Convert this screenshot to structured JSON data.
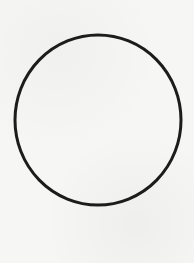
{
  "figure": {
    "shape": "circle-outline",
    "background_color": "#f6f6f4",
    "stroke_color": "#1c1c1c",
    "stroke_width": 3,
    "center_x": 98,
    "center_y": 120,
    "radius_x": 83,
    "radius_y": 85
  }
}
